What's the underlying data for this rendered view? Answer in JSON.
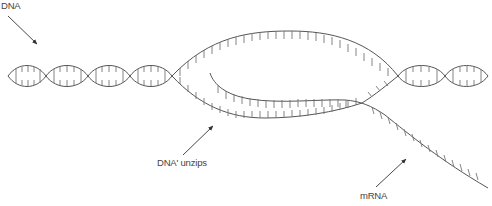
{
  "diagram": {
    "labels": {
      "dna": "DNA",
      "unzips": "DNA' unzips",
      "mrna": "mRNA"
    },
    "colors": {
      "stroke": "#555555",
      "rung": "#777777",
      "text": "#444444",
      "background": "#ffffff"
    }
  }
}
